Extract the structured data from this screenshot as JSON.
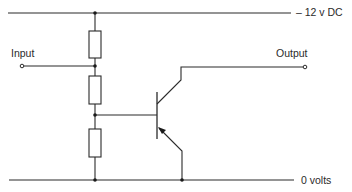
{
  "diagram": {
    "type": "circuit-schematic",
    "labels": {
      "supply": "– 12 v DC",
      "ground": "0 volts",
      "input": "Input",
      "output": "Output"
    },
    "components": [
      {
        "id": "R1",
        "type": "resistor",
        "position": "top"
      },
      {
        "id": "R2",
        "type": "resistor",
        "position": "middle"
      },
      {
        "id": "R3",
        "type": "resistor",
        "position": "bottom"
      },
      {
        "id": "Q1",
        "type": "transistor",
        "polarity": "PNP"
      }
    ],
    "colors": {
      "line": "#2b2b2b",
      "background": "#ffffff"
    }
  }
}
